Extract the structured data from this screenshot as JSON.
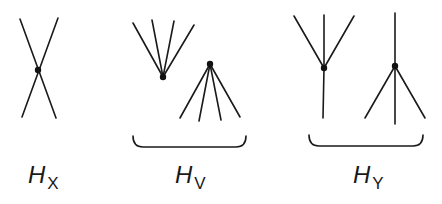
{
  "diagram": {
    "groups": [
      {
        "id": "HX",
        "label": "H",
        "subscript": "X"
      },
      {
        "id": "HV",
        "label": "H",
        "subscript": "V"
      },
      {
        "id": "HY",
        "label": "H",
        "subscript": "Y"
      }
    ],
    "colors": {
      "stroke": "#1a1a1a",
      "background": "#ffffff"
    }
  }
}
